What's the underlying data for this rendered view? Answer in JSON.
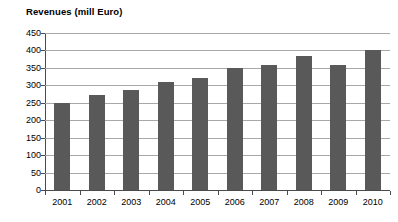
{
  "chart_data": {
    "type": "bar",
    "title": "Revenues (mill Euro)",
    "xlabel": "",
    "ylabel": "",
    "categories": [
      "2001",
      "2002",
      "2003",
      "2004",
      "2005",
      "2006",
      "2007",
      "2008",
      "2009",
      "2010"
    ],
    "values": [
      250,
      272,
      288,
      310,
      320,
      350,
      358,
      385,
      358,
      400
    ],
    "series": [
      {
        "name": "Revenues",
        "values": [
          250,
          272,
          288,
          310,
          320,
          350,
          358,
          385,
          358,
          400
        ]
      }
    ],
    "ylim": [
      0,
      450
    ],
    "ytick_step": 50,
    "yticks": [
      450,
      400,
      350,
      300,
      250,
      200,
      150,
      100,
      50,
      0
    ],
    "ytick_labels": [
      "450",
      "400",
      "350",
      "300",
      "250",
      "200",
      "150",
      "100",
      "50",
      "0"
    ],
    "grid": true,
    "grid_axis": "y",
    "legend": false,
    "legend_position": "none",
    "bar_color": "#595959",
    "gridline_color": "#a8a8a8",
    "axis_color": "#4a4a4a",
    "background_color": "#ffffff"
  }
}
